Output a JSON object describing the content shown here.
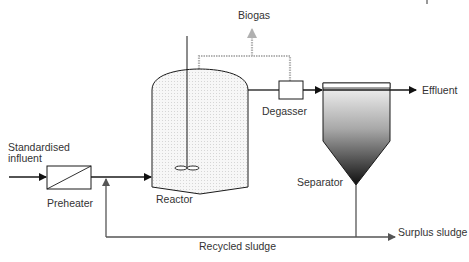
{
  "diagram": {
    "labels": {
      "biogas": "Biogas",
      "effluent": "Effluent",
      "degasser": "Degasser",
      "influent_line1": "Standardised",
      "influent_line2": "influent",
      "preheater": "Preheater",
      "reactor": "Reactor",
      "separator": "Separator",
      "recycled_sludge": "Recycled sludge",
      "surplus_sludge": "Surplus sludge"
    },
    "components": [
      "Preheater",
      "Reactor",
      "Degasser",
      "Separator"
    ],
    "flows": [
      {
        "from": "Standardised influent",
        "to": "Preheater"
      },
      {
        "from": "Preheater",
        "to": "Reactor"
      },
      {
        "from": "Reactor",
        "to": "Biogas"
      },
      {
        "from": "Degasser",
        "to": "Biogas"
      },
      {
        "from": "Reactor",
        "to": "Degasser"
      },
      {
        "from": "Degasser",
        "to": "Separator"
      },
      {
        "from": "Separator",
        "to": "Effluent"
      },
      {
        "from": "Separator",
        "to": "Recycled sludge"
      },
      {
        "from": "Recycled sludge",
        "to": "Reactor"
      },
      {
        "from": "Separator",
        "to": "Surplus sludge"
      }
    ],
    "colors": {
      "line": "#1a1a1a",
      "gas_line": "#aaaaaa",
      "sludge_line": "#555555",
      "reactor_fill": "#ececec",
      "separator_gradient_top": "#f4f4f4",
      "separator_gradient_bottom": "#1a1a1a"
    }
  }
}
